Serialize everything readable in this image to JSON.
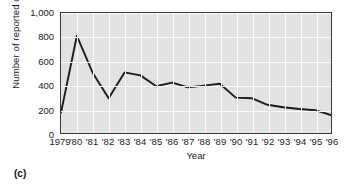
{
  "figure": {
    "caption": "(c)"
  },
  "chart_data": {
    "type": "line",
    "title": "",
    "xlabel": "Year",
    "ylabel": "Number of reported cases",
    "categories": [
      "1979",
      "'80",
      "'81",
      "'82",
      "'83",
      "'84",
      "'85",
      "'86",
      "'87",
      "'88",
      "'89",
      "'90",
      "'91",
      "'92",
      "'93",
      "'94",
      "'95",
      "'96"
    ],
    "x": [
      1979,
      1980,
      1981,
      1982,
      1983,
      1984,
      1985,
      1986,
      1987,
      1988,
      1989,
      1990,
      1991,
      1992,
      1993,
      1994,
      1995,
      1996
    ],
    "values": [
      170,
      810,
      500,
      290,
      505,
      480,
      390,
      420,
      380,
      395,
      410,
      295,
      290,
      235,
      215,
      200,
      190,
      150
    ],
    "ylim": [
      0,
      1000
    ],
    "yticks": [
      0,
      200,
      400,
      600,
      800,
      1000
    ],
    "ytick_labels": [
      "0",
      "200",
      "400",
      "600",
      "800",
      "1,000"
    ],
    "grid": true,
    "legend": "none",
    "line_color": "#1a1a1a",
    "plot_background": "#e2e2e2",
    "gridline_color": "#fbfbfb"
  }
}
